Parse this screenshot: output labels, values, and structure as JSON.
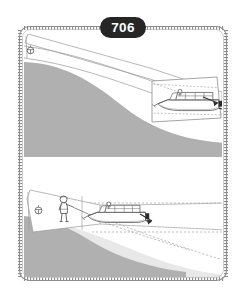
{
  "figure": {
    "number": "706",
    "badge_color": "#262626",
    "badge_text_color": "#ffffff"
  },
  "palette": {
    "page_background": "#ffffff",
    "frame_stroke": "#8d8d8d",
    "land_dark_gray": "#b0b0b0",
    "land_light_gray": "#e8e8e8",
    "line_ink": "#6d6d6d",
    "detail_ink": "#4a4a4a",
    "dashed_ink": "#9a9a9a",
    "water_white": "#fdfdfd"
  },
  "frame": {
    "name": "rounded-hatched-border",
    "corner_radius": "10",
    "hatch_pattern": "tick-marks"
  },
  "panels": [
    {
      "id": "panel-top",
      "label": "",
      "scene": "boat-approaching-shore",
      "elements": [
        {
          "name": "shoreline-land",
          "fill": "#b0b0b0"
        },
        {
          "name": "water-channel",
          "fill": "#ffffff"
        },
        {
          "name": "dock-marker-buoy",
          "fill": "#ffffff"
        },
        {
          "name": "inset-panel-boat",
          "fill": "#ffffff"
        },
        {
          "name": "motorboat",
          "fill": "#ffffff"
        },
        {
          "name": "direction-arrow",
          "fill": "#2d2d2d"
        }
      ]
    },
    {
      "id": "panel-bottom",
      "label": "",
      "scene": "person-on-shore-with-boat",
      "elements": [
        {
          "name": "shoreline-land",
          "fill": "#b0b0b0"
        },
        {
          "name": "shallow-bank",
          "fill": "#e8e8e8"
        },
        {
          "name": "dock-marker-buoy",
          "fill": "#ffffff"
        },
        {
          "name": "person-figure",
          "fill": "#ffffff"
        },
        {
          "name": "mooring-rope",
          "fill": "none"
        },
        {
          "name": "motorboat",
          "fill": "#ffffff"
        },
        {
          "name": "direction-arrow",
          "fill": "#2d2d2d"
        }
      ]
    }
  ]
}
